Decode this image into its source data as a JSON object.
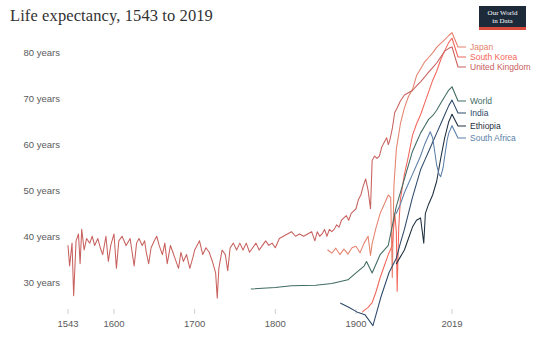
{
  "header": {
    "title": "Life expectancy, 1543 to 2019",
    "logo": {
      "line1": "Our World",
      "line2": "in Data"
    }
  },
  "chart_data": {
    "type": "line",
    "title": "Life expectancy, 1543 to 2019",
    "xlabel": "",
    "ylabel": "",
    "xlim": [
      1543,
      2019
    ],
    "ylim": [
      25,
      85
    ],
    "grid": false,
    "legend_position": "right",
    "x_ticks": [
      1543,
      1600,
      1700,
      1800,
      1900,
      2019
    ],
    "x_tick_labels": [
      "1543",
      "1600",
      "1700",
      "1800",
      "1900",
      "2019"
    ],
    "y_ticks": [
      30,
      40,
      50,
      60,
      70,
      80
    ],
    "y_tick_labels": [
      "30 years",
      "40 years",
      "50 years",
      "60 years",
      "70 years",
      "80 years"
    ],
    "series": [
      {
        "name": "Japan",
        "color": "#e4826d",
        "legend_y": 47,
        "end_value": 84.4,
        "points": [
          [
            1865,
            37.0
          ],
          [
            1870,
            36.3
          ],
          [
            1875,
            37.4
          ],
          [
            1880,
            36.0
          ],
          [
            1885,
            37.2
          ],
          [
            1890,
            36.1
          ],
          [
            1895,
            37.5
          ],
          [
            1900,
            37.8
          ],
          [
            1905,
            36.4
          ],
          [
            1910,
            38.5
          ],
          [
            1915,
            40.0
          ],
          [
            1918,
            35.8
          ],
          [
            1920,
            38.4
          ],
          [
            1925,
            42.0
          ],
          [
            1930,
            45.0
          ],
          [
            1935,
            47.0
          ],
          [
            1940,
            49.0
          ],
          [
            1943,
            48.5
          ],
          [
            1945,
            31.0
          ],
          [
            1947,
            51.0
          ],
          [
            1950,
            59.0
          ],
          [
            1955,
            64.5
          ],
          [
            1960,
            68.0
          ],
          [
            1965,
            70.5
          ],
          [
            1970,
            72.0
          ],
          [
            1975,
            75.0
          ],
          [
            1980,
            76.5
          ],
          [
            1985,
            78.0
          ],
          [
            1990,
            79.0
          ],
          [
            1995,
            80.0
          ],
          [
            2000,
            81.2
          ],
          [
            2005,
            82.1
          ],
          [
            2010,
            82.9
          ],
          [
            2015,
            83.8
          ],
          [
            2019,
            84.4
          ]
        ]
      },
      {
        "name": "South Korea",
        "color": "#f2665a",
        "legend_y": 57,
        "end_value": 83.2,
        "points": [
          [
            1908,
            23.5
          ],
          [
            1915,
            24.5
          ],
          [
            1920,
            25.5
          ],
          [
            1925,
            28.0
          ],
          [
            1930,
            31.0
          ],
          [
            1935,
            33.5
          ],
          [
            1940,
            36.0
          ],
          [
            1945,
            38.0
          ],
          [
            1948,
            45.0
          ],
          [
            1950,
            41.0
          ],
          [
            1951,
            28.0
          ],
          [
            1953,
            42.0
          ],
          [
            1955,
            48.0
          ],
          [
            1960,
            53.5
          ],
          [
            1965,
            57.5
          ],
          [
            1970,
            62.0
          ],
          [
            1975,
            64.5
          ],
          [
            1980,
            66.5
          ],
          [
            1985,
            69.0
          ],
          [
            1990,
            71.5
          ],
          [
            1995,
            74.0
          ],
          [
            2000,
            76.0
          ],
          [
            2005,
            78.5
          ],
          [
            2010,
            80.5
          ],
          [
            2015,
            82.3
          ],
          [
            2019,
            83.2
          ]
        ]
      },
      {
        "name": "United Kingdom",
        "color": "#c8615e",
        "legend_y": 67,
        "end_value": 81.3,
        "points": [
          [
            1543,
            38.0
          ],
          [
            1545,
            33.5
          ],
          [
            1548,
            38.5
          ],
          [
            1550,
            27.0
          ],
          [
            1553,
            39.0
          ],
          [
            1556,
            40.5
          ],
          [
            1558,
            34.0
          ],
          [
            1560,
            41.5
          ],
          [
            1563,
            37.0
          ],
          [
            1566,
            39.5
          ],
          [
            1570,
            38.5
          ],
          [
            1573,
            40.0
          ],
          [
            1576,
            38.0
          ],
          [
            1580,
            39.5
          ],
          [
            1583,
            37.5
          ],
          [
            1586,
            36.0
          ],
          [
            1590,
            40.0
          ],
          [
            1593,
            34.5
          ],
          [
            1596,
            38.0
          ],
          [
            1600,
            40.5
          ],
          [
            1603,
            33.0
          ],
          [
            1606,
            39.0
          ],
          [
            1610,
            40.0
          ],
          [
            1615,
            38.0
          ],
          [
            1620,
            39.5
          ],
          [
            1625,
            33.5
          ],
          [
            1628,
            38.5
          ],
          [
            1631,
            39.5
          ],
          [
            1635,
            38.0
          ],
          [
            1638,
            39.0
          ],
          [
            1640,
            36.5
          ],
          [
            1643,
            34.0
          ],
          [
            1646,
            37.5
          ],
          [
            1650,
            39.0
          ],
          [
            1653,
            40.0
          ],
          [
            1656,
            38.0
          ],
          [
            1660,
            36.0
          ],
          [
            1663,
            38.5
          ],
          [
            1666,
            34.0
          ],
          [
            1670,
            38.0
          ],
          [
            1673,
            36.5
          ],
          [
            1676,
            35.0
          ],
          [
            1680,
            33.0
          ],
          [
            1683,
            36.5
          ],
          [
            1686,
            34.5
          ],
          [
            1690,
            36.0
          ],
          [
            1694,
            33.0
          ],
          [
            1698,
            35.5
          ],
          [
            1700,
            37.0
          ],
          [
            1703,
            38.0
          ],
          [
            1706,
            39.0
          ],
          [
            1710,
            36.0
          ],
          [
            1714,
            37.5
          ],
          [
            1718,
            36.5
          ],
          [
            1722,
            34.5
          ],
          [
            1726,
            32.0
          ],
          [
            1728,
            26.5
          ],
          [
            1730,
            33.0
          ],
          [
            1734,
            37.0
          ],
          [
            1738,
            36.0
          ],
          [
            1741,
            32.5
          ],
          [
            1744,
            37.5
          ],
          [
            1748,
            38.5
          ],
          [
            1752,
            37.0
          ],
          [
            1756,
            38.5
          ],
          [
            1760,
            37.0
          ],
          [
            1764,
            38.5
          ],
          [
            1768,
            36.5
          ],
          [
            1772,
            37.5
          ],
          [
            1776,
            38.5
          ],
          [
            1780,
            37.0
          ],
          [
            1784,
            38.0
          ],
          [
            1788,
            39.0
          ],
          [
            1792,
            38.0
          ],
          [
            1796,
            38.5
          ],
          [
            1800,
            37.5
          ],
          [
            1805,
            39.5
          ],
          [
            1810,
            40.0
          ],
          [
            1815,
            40.5
          ],
          [
            1820,
            41.0
          ],
          [
            1825,
            40.0
          ],
          [
            1830,
            40.5
          ],
          [
            1835,
            40.0
          ],
          [
            1840,
            40.5
          ],
          [
            1845,
            41.0
          ],
          [
            1849,
            39.0
          ],
          [
            1852,
            41.0
          ],
          [
            1855,
            40.0
          ],
          [
            1858,
            40.5
          ],
          [
            1861,
            41.5
          ],
          [
            1864,
            40.0
          ],
          [
            1867,
            41.5
          ],
          [
            1870,
            41.0
          ],
          [
            1873,
            41.5
          ],
          [
            1876,
            42.5
          ],
          [
            1879,
            42.0
          ],
          [
            1882,
            43.5
          ],
          [
            1885,
            44.0
          ],
          [
            1888,
            44.5
          ],
          [
            1891,
            43.5
          ],
          [
            1894,
            45.0
          ],
          [
            1897,
            45.5
          ],
          [
            1900,
            46.0
          ],
          [
            1903,
            48.0
          ],
          [
            1906,
            49.0
          ],
          [
            1909,
            51.0
          ],
          [
            1912,
            52.5
          ],
          [
            1915,
            50.0
          ],
          [
            1918,
            46.0
          ],
          [
            1920,
            56.5
          ],
          [
            1923,
            57.5
          ],
          [
            1926,
            57.0
          ],
          [
            1929,
            57.5
          ],
          [
            1932,
            59.5
          ],
          [
            1935,
            60.5
          ],
          [
            1938,
            61.5
          ],
          [
            1940,
            60.0
          ],
          [
            1942,
            61.0
          ],
          [
            1945,
            63.5
          ],
          [
            1948,
            67.0
          ],
          [
            1951,
            68.0
          ],
          [
            1955,
            69.5
          ],
          [
            1960,
            70.8
          ],
          [
            1965,
            71.3
          ],
          [
            1970,
            71.8
          ],
          [
            1975,
            72.8
          ],
          [
            1980,
            73.7
          ],
          [
            1985,
            74.7
          ],
          [
            1990,
            75.8
          ],
          [
            1995,
            76.8
          ],
          [
            2000,
            77.8
          ],
          [
            2005,
            79.1
          ],
          [
            2010,
            80.4
          ],
          [
            2015,
            81.0
          ],
          [
            2019,
            81.3
          ]
        ]
      },
      {
        "name": "World",
        "color": "#3f6b63",
        "legend_y": 101,
        "end_value": 72.6,
        "points": [
          [
            1770,
            28.5
          ],
          [
            1800,
            28.8
          ],
          [
            1820,
            29.2
          ],
          [
            1850,
            29.3
          ],
          [
            1870,
            29.7
          ],
          [
            1890,
            30.5
          ],
          [
            1900,
            32.0
          ],
          [
            1910,
            33.5
          ],
          [
            1913,
            34.5
          ],
          [
            1920,
            32.0
          ],
          [
            1930,
            36.0
          ],
          [
            1940,
            38.0
          ],
          [
            1950,
            46.5
          ],
          [
            1955,
            49.5
          ],
          [
            1960,
            52.5
          ],
          [
            1965,
            55.5
          ],
          [
            1970,
            58.5
          ],
          [
            1975,
            60.5
          ],
          [
            1980,
            62.5
          ],
          [
            1985,
            64.0
          ],
          [
            1990,
            65.5
          ],
          [
            1995,
            66.3
          ],
          [
            2000,
            67.5
          ],
          [
            2005,
            69.0
          ],
          [
            2010,
            70.5
          ],
          [
            2015,
            71.9
          ],
          [
            2019,
            72.6
          ]
        ]
      },
      {
        "name": "India",
        "color": "#2d4a6b",
        "legend_y": 113,
        "end_value": 69.7,
        "points": [
          [
            1881,
            25.4
          ],
          [
            1891,
            24.5
          ],
          [
            1901,
            23.5
          ],
          [
            1911,
            22.9
          ],
          [
            1921,
            20.5
          ],
          [
            1931,
            26.8
          ],
          [
            1941,
            32.1
          ],
          [
            1950,
            35.2
          ],
          [
            1955,
            38.5
          ],
          [
            1960,
            41.5
          ],
          [
            1965,
            45.0
          ],
          [
            1970,
            48.5
          ],
          [
            1975,
            51.5
          ],
          [
            1980,
            54.5
          ],
          [
            1985,
            56.5
          ],
          [
            1990,
            58.5
          ],
          [
            1995,
            60.5
          ],
          [
            2000,
            62.5
          ],
          [
            2005,
            64.5
          ],
          [
            2010,
            66.5
          ],
          [
            2015,
            68.5
          ],
          [
            2019,
            69.7
          ]
        ]
      },
      {
        "name": "Ethiopia",
        "color": "#1f3040",
        "legend_y": 126,
        "end_value": 66.6,
        "points": [
          [
            1950,
            34.0
          ],
          [
            1955,
            35.5
          ],
          [
            1960,
            37.0
          ],
          [
            1965,
            39.5
          ],
          [
            1970,
            42.0
          ],
          [
            1975,
            43.5
          ],
          [
            1980,
            44.0
          ],
          [
            1984,
            38.5
          ],
          [
            1986,
            45.0
          ],
          [
            1990,
            47.0
          ],
          [
            1995,
            49.0
          ],
          [
            2000,
            52.0
          ],
          [
            2005,
            57.0
          ],
          [
            2010,
            61.5
          ],
          [
            2015,
            65.0
          ],
          [
            2019,
            66.6
          ]
        ]
      },
      {
        "name": "South Africa",
        "color": "#5a7fa8",
        "legend_y": 138,
        "end_value": 64.1,
        "points": [
          [
            1950,
            45.0
          ],
          [
            1955,
            47.0
          ],
          [
            1960,
            49.5
          ],
          [
            1965,
            51.5
          ],
          [
            1970,
            53.5
          ],
          [
            1975,
            55.5
          ],
          [
            1980,
            57.5
          ],
          [
            1985,
            60.0
          ],
          [
            1990,
            62.0
          ],
          [
            1992,
            62.8
          ],
          [
            1995,
            61.5
          ],
          [
            1998,
            58.0
          ],
          [
            2000,
            55.5
          ],
          [
            2003,
            53.5
          ],
          [
            2005,
            53.0
          ],
          [
            2008,
            55.0
          ],
          [
            2010,
            57.5
          ],
          [
            2013,
            61.0
          ],
          [
            2015,
            62.5
          ],
          [
            2019,
            64.1
          ]
        ]
      }
    ]
  }
}
